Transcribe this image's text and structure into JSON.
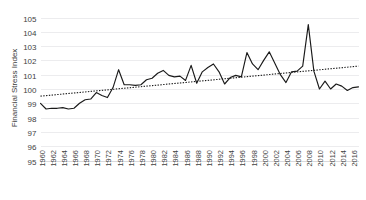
{
  "chart_data": {
    "type": "line",
    "title": "",
    "xlabel": "",
    "ylabel": "Financial Stress Index",
    "ylim": [
      95,
      105
    ],
    "ytick_step": 1,
    "yticks": [
      95,
      96,
      97,
      98,
      99,
      100,
      101,
      102,
      103,
      104,
      105
    ],
    "xlim": [
      1960,
      2017
    ],
    "xtick_step": 2,
    "xticks": [
      1960,
      1962,
      1964,
      1966,
      1968,
      1970,
      1972,
      1974,
      1976,
      1978,
      1980,
      1982,
      1984,
      1986,
      1988,
      1990,
      1992,
      1994,
      1996,
      1998,
      2000,
      2002,
      2004,
      2006,
      2008,
      2010,
      2012,
      2014,
      2016
    ],
    "grid": true,
    "grid_axis": "y",
    "legend": false,
    "legend_position": "none",
    "series": [
      {
        "name": "Financial Stress Index",
        "style": "solid",
        "color": "#1a1a1a",
        "x": [
          1960,
          1961,
          1962,
          1963,
          1964,
          1965,
          1966,
          1967,
          1968,
          1969,
          1970,
          1971,
          1972,
          1973,
          1974,
          1975,
          1976,
          1977,
          1978,
          1979,
          1980,
          1981,
          1982,
          1983,
          1984,
          1985,
          1986,
          1987,
          1988,
          1989,
          1990,
          1991,
          1992,
          1993,
          1994,
          1995,
          1996,
          1997,
          1998,
          1999,
          2000,
          2001,
          2002,
          2003,
          2004,
          2005,
          2006,
          2007,
          2008,
          2009,
          2010,
          2011,
          2012,
          2013,
          2014,
          2015,
          2016,
          2017
        ],
        "values": [
          99.0,
          98.6,
          98.65,
          98.65,
          98.7,
          98.6,
          98.65,
          99.0,
          99.25,
          99.3,
          99.75,
          99.55,
          99.4,
          100.1,
          101.35,
          100.3,
          100.3,
          100.25,
          100.3,
          100.65,
          100.75,
          101.1,
          101.3,
          100.95,
          100.85,
          100.9,
          100.6,
          101.65,
          100.4,
          101.2,
          101.5,
          101.75,
          101.2,
          100.35,
          100.8,
          100.95,
          100.85,
          102.55,
          101.75,
          101.35,
          102.0,
          102.6,
          101.8,
          101.0,
          100.45,
          101.2,
          101.25,
          101.6,
          104.5,
          101.25,
          100.0,
          100.55,
          100.0,
          100.35,
          100.2,
          99.9,
          100.1,
          100.15
        ]
      },
      {
        "name": "Linear trend",
        "style": "dotted",
        "color": "#1a1a1a",
        "x": [
          1960,
          2017
        ],
        "values": [
          99.5,
          101.6
        ]
      }
    ]
  },
  "axis": {
    "y_title": "Financial Stress Index"
  }
}
